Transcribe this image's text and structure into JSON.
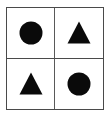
{
  "figure": {
    "kind": "shape-matrix",
    "rows": 2,
    "columns": 2,
    "background_color": "#ffffff",
    "border_color": "#4a4a4a",
    "divider_color": "#595959",
    "shape_color": "#0a0a0a"
  },
  "cells": [
    {
      "row": 0,
      "column": 0,
      "position": "top-left",
      "shape": "circle",
      "shape_icon": "filled-circle-icon",
      "fill": "solid",
      "color": "#0a0a0a"
    },
    {
      "row": 0,
      "column": 1,
      "position": "top-right",
      "shape": "triangle",
      "shape_icon": "filled-triangle-icon",
      "fill": "solid",
      "color": "#0a0a0a"
    },
    {
      "row": 1,
      "column": 0,
      "position": "bottom-left",
      "shape": "triangle",
      "shape_icon": "filled-triangle-icon",
      "fill": "solid",
      "color": "#0a0a0a"
    },
    {
      "row": 1,
      "column": 1,
      "position": "bottom-right",
      "shape": "circle",
      "shape_icon": "filled-circle-icon",
      "fill": "solid",
      "color": "#0a0a0a"
    }
  ]
}
